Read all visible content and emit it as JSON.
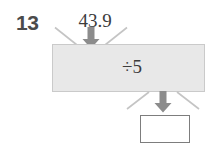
{
  "exercise": {
    "number": "13",
    "input_value": "43.9",
    "operation": "÷5",
    "answer_value": "",
    "answer_placeholder": ""
  },
  "icons": {
    "input_arrow": "arrow-down-icon",
    "output_arrow": "arrow-down-icon",
    "input_burst_left": "diagonal-line-icon",
    "input_burst_right": "diagonal-line-icon",
    "output_burst_left": "diagonal-line-icon",
    "output_burst_right": "diagonal-line-icon"
  },
  "colors": {
    "machine_fill": "#e8e8e8",
    "machine_border": "#cacaca",
    "arrow": "#8c8c8c",
    "burst_line": "#c4c4c4",
    "number_text": "#4b4b4b",
    "serif_text": "#3c3c3c",
    "answer_border": "#7d7d7d",
    "page_background": "#ffffff"
  }
}
